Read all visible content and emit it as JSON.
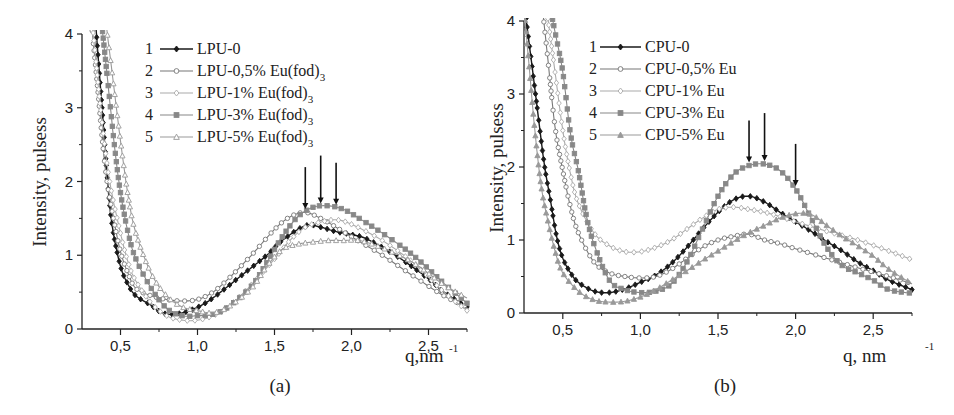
{
  "chart_data": [
    {
      "panel_label": "(a)",
      "type": "line",
      "title": "",
      "xlabel": "q,nm",
      "xlabel_superscript": "-1",
      "ylabel": "Intensity, pulsess",
      "xlim": [
        0.25,
        2.75
      ],
      "ylim": [
        0,
        4
      ],
      "xticks": [
        "0,5",
        "1,0",
        "1,5",
        "2,0",
        "2,5"
      ],
      "yticks": [
        "0",
        "1",
        "2",
        "3",
        "4"
      ],
      "grid": false,
      "legend_position": "upper-center",
      "peak_arrows_q": [
        1.7,
        1.8,
        1.9
      ],
      "series": [
        {
          "num": "1",
          "name": "LPU-0",
          "marker": "diamond-filled",
          "color": "#1a1a1a",
          "x": [
            0.38,
            0.42,
            0.45,
            0.5,
            0.55,
            0.6,
            0.7,
            0.77,
            0.85,
            0.95,
            1.05,
            1.15,
            1.3,
            1.45,
            1.55,
            1.7,
            1.8,
            1.9,
            2.0,
            2.1,
            2.3,
            2.5,
            2.6,
            2.75
          ],
          "y": [
            3.0,
            1.9,
            1.35,
            0.85,
            0.6,
            0.45,
            0.32,
            0.22,
            0.2,
            0.25,
            0.35,
            0.5,
            0.75,
            1.0,
            1.2,
            1.4,
            1.38,
            1.32,
            1.28,
            1.22,
            0.98,
            0.68,
            0.5,
            0.3
          ]
        },
        {
          "num": "2",
          "name": "LPU-0,5% Eu(fod)3",
          "marker": "circle-open",
          "color": "#777777",
          "x": [
            0.35,
            0.4,
            0.45,
            0.5,
            0.55,
            0.6,
            0.7,
            0.8,
            0.9,
            1.0,
            1.1,
            1.2,
            1.35,
            1.5,
            1.6,
            1.7,
            1.8,
            1.9,
            2.0,
            2.2,
            2.4,
            2.6,
            2.75
          ],
          "y": [
            3.3,
            2.2,
            1.55,
            1.05,
            0.75,
            0.55,
            0.45,
            0.4,
            0.38,
            0.4,
            0.5,
            0.68,
            1.0,
            1.35,
            1.52,
            1.58,
            1.5,
            1.38,
            1.25,
            1.0,
            0.72,
            0.45,
            0.3
          ]
        },
        {
          "num": "3",
          "name": "LPU-1% Eu(fod)3",
          "marker": "diamond-open",
          "color": "#aaaaaa",
          "x": [
            0.33,
            0.38,
            0.43,
            0.5,
            0.55,
            0.6,
            0.7,
            0.8,
            0.9,
            1.0,
            1.1,
            1.2,
            1.35,
            1.5,
            1.6,
            1.7,
            1.8,
            1.9,
            2.0,
            2.2,
            2.4,
            2.6,
            2.75
          ],
          "y": [
            3.85,
            2.8,
            2.0,
            1.3,
            0.9,
            0.65,
            0.35,
            0.18,
            0.12,
            0.12,
            0.18,
            0.3,
            0.6,
            0.95,
            1.2,
            1.38,
            1.45,
            1.48,
            1.42,
            1.2,
            0.9,
            0.5,
            0.25
          ]
        },
        {
          "num": "4",
          "name": "LPU-3% Eu(fod)3",
          "marker": "square-filled",
          "color": "#888888",
          "x": [
            0.42,
            0.46,
            0.5,
            0.55,
            0.6,
            0.7,
            0.8,
            0.9,
            1.0,
            1.1,
            1.2,
            1.35,
            1.45,
            1.55,
            1.65,
            1.75,
            1.85,
            1.95,
            2.05,
            2.2,
            2.4,
            2.6,
            2.75
          ],
          "y": [
            3.3,
            2.5,
            1.85,
            1.3,
            0.95,
            0.55,
            0.28,
            0.18,
            0.18,
            0.2,
            0.3,
            0.58,
            0.9,
            1.25,
            1.52,
            1.65,
            1.67,
            1.62,
            1.5,
            1.3,
            1.0,
            0.62,
            0.35
          ]
        },
        {
          "num": "5",
          "name": "LPU-5% Eu(fod)3",
          "marker": "triangle-open",
          "color": "#999999",
          "x": [
            0.45,
            0.5,
            0.55,
            0.6,
            0.7,
            0.8,
            0.9,
            1.0,
            1.1,
            1.2,
            1.35,
            1.45,
            1.55,
            1.65,
            1.75,
            1.85,
            1.95,
            2.05,
            2.2,
            2.4,
            2.6,
            2.75
          ],
          "y": [
            3.4,
            2.55,
            1.8,
            1.3,
            0.75,
            0.45,
            0.3,
            0.25,
            0.22,
            0.3,
            0.55,
            0.85,
            1.08,
            1.15,
            1.18,
            1.2,
            1.2,
            1.2,
            1.1,
            0.9,
            0.6,
            0.42
          ]
        }
      ]
    },
    {
      "panel_label": "(b)",
      "type": "line",
      "title": "",
      "xlabel": "q, nm",
      "xlabel_superscript": "-1",
      "ylabel": "Intensity, pulsess",
      "xlim": [
        0.25,
        2.75
      ],
      "ylim": [
        0,
        4
      ],
      "xticks": [
        "0,5",
        "1,0",
        "1,5",
        "2,0",
        "2,5"
      ],
      "yticks": [
        "0",
        "1",
        "2",
        "3",
        "4"
      ],
      "grid": false,
      "legend_position": "upper-center",
      "peak_arrows_q": [
        1.7,
        1.8,
        2.0
      ],
      "series": [
        {
          "num": "1",
          "name": "CPU-0",
          "marker": "diamond-filled",
          "color": "#1a1a1a",
          "x": [
            0.33,
            0.38,
            0.42,
            0.46,
            0.5,
            0.55,
            0.6,
            0.7,
            0.8,
            0.9,
            1.0,
            1.1,
            1.2,
            1.3,
            1.4,
            1.5,
            1.6,
            1.7,
            1.8,
            1.9,
            2.0,
            2.1,
            2.2,
            2.3,
            2.4,
            2.5,
            2.6,
            2.75
          ],
          "y": [
            2.9,
            2.05,
            1.55,
            1.05,
            0.75,
            0.55,
            0.42,
            0.3,
            0.28,
            0.33,
            0.42,
            0.52,
            0.68,
            0.9,
            1.15,
            1.38,
            1.55,
            1.6,
            1.52,
            1.38,
            1.25,
            1.12,
            0.98,
            0.85,
            0.7,
            0.58,
            0.45,
            0.32
          ]
        },
        {
          "num": "2",
          "name": "CPU-0,5% Eu",
          "marker": "circle-open",
          "color": "#777777",
          "x": [
            0.4,
            0.45,
            0.5,
            0.55,
            0.6,
            0.7,
            0.8,
            0.9,
            1.0,
            1.1,
            1.2,
            1.3,
            1.4,
            1.5,
            1.6,
            1.7,
            1.8,
            1.9,
            2.0,
            2.2,
            2.4,
            2.6,
            2.75
          ],
          "y": [
            3.55,
            2.55,
            1.95,
            1.45,
            1.1,
            0.7,
            0.55,
            0.5,
            0.48,
            0.5,
            0.6,
            0.75,
            0.9,
            1.0,
            1.05,
            1.08,
            1.0,
            0.95,
            0.88,
            0.75,
            0.62,
            0.5,
            0.4
          ]
        },
        {
          "num": "3",
          "name": "CPU-1% Eu",
          "marker": "diamond-open",
          "color": "#aaaaaa",
          "x": [
            0.45,
            0.5,
            0.55,
            0.6,
            0.7,
            0.8,
            0.9,
            1.0,
            1.1,
            1.2,
            1.3,
            1.4,
            1.5,
            1.6,
            1.7,
            1.8,
            1.9,
            2.0,
            2.2,
            2.4,
            2.6,
            2.75
          ],
          "y": [
            3.3,
            2.5,
            1.9,
            1.5,
            1.1,
            0.92,
            0.84,
            0.84,
            0.9,
            1.0,
            1.15,
            1.3,
            1.42,
            1.45,
            1.42,
            1.38,
            1.32,
            1.25,
            1.12,
            1.0,
            0.85,
            0.73
          ]
        },
        {
          "num": "4",
          "name": "CPU-3% Eu",
          "marker": "square-filled",
          "color": "#888888",
          "x": [
            0.45,
            0.5,
            0.55,
            0.6,
            0.65,
            0.7,
            0.8,
            0.9,
            1.0,
            1.1,
            1.2,
            1.3,
            1.4,
            1.5,
            1.6,
            1.7,
            1.8,
            1.9,
            2.0,
            2.1,
            2.2,
            2.3,
            2.4,
            2.5,
            2.6,
            2.75
          ],
          "y": [
            3.85,
            3.3,
            2.45,
            1.95,
            1.35,
            0.95,
            0.45,
            0.32,
            0.28,
            0.3,
            0.4,
            0.7,
            1.15,
            1.6,
            1.9,
            2.02,
            2.04,
            1.95,
            1.7,
            1.3,
            0.9,
            0.65,
            0.55,
            0.45,
            0.32,
            0.27
          ]
        },
        {
          "num": "5",
          "name": "CPU-5% Eu",
          "marker": "triangle-filled",
          "color": "#999999",
          "x": [
            0.28,
            0.32,
            0.36,
            0.4,
            0.45,
            0.5,
            0.6,
            0.7,
            0.8,
            0.9,
            1.0,
            1.1,
            1.2,
            1.3,
            1.4,
            1.5,
            1.6,
            1.7,
            1.8,
            1.9,
            2.0,
            2.1,
            2.2,
            2.3,
            2.4,
            2.5,
            2.6,
            2.75
          ],
          "y": [
            3.45,
            2.5,
            1.75,
            1.3,
            0.85,
            0.55,
            0.3,
            0.18,
            0.15,
            0.16,
            0.22,
            0.32,
            0.45,
            0.58,
            0.72,
            0.85,
            0.98,
            1.1,
            1.2,
            1.3,
            1.36,
            1.35,
            1.2,
            1.05,
            0.92,
            0.78,
            0.6,
            0.4
          ]
        }
      ]
    }
  ]
}
